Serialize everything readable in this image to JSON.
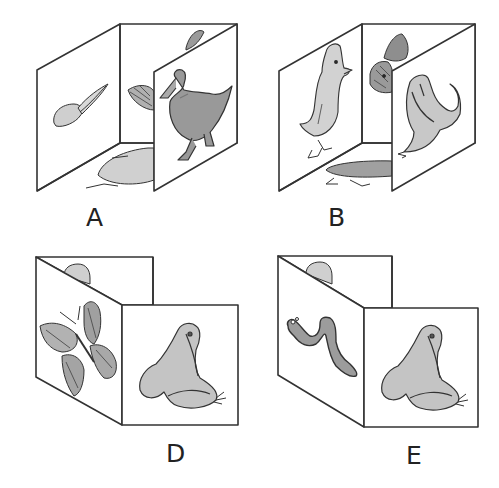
{
  "figures": [
    {
      "id": "A",
      "label": "A",
      "form": "open-box",
      "panels": {
        "left": "tadpole",
        "back": "butterfly",
        "bottom": "duckling",
        "right": "duck"
      }
    },
    {
      "id": "B",
      "label": "B",
      "form": "open-box",
      "panels": {
        "left": "duckling",
        "back": "butterfly",
        "bottom": "tadpole",
        "right": "frog"
      }
    },
    {
      "id": "D",
      "label": "D",
      "form": "folded-card",
      "panels": {
        "back": "egg-blob",
        "left": "butterfly",
        "front": "frog"
      }
    },
    {
      "id": "E",
      "label": "E",
      "form": "folded-card",
      "panels": {
        "back": "egg-blob",
        "left": "caterpillar",
        "front": "frog"
      }
    }
  ],
  "colors": {
    "line": "#333333",
    "fill_light": "#cfcfcf",
    "fill_mid": "#a8a8a8",
    "fill_dark": "#8a8a8a",
    "background": "#ffffff"
  }
}
